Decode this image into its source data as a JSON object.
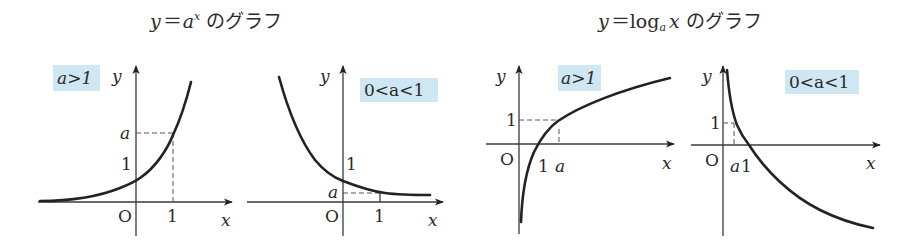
{
  "titles": {
    "exp": {
      "y": "y",
      "eq": "＝",
      "base": "a",
      "exp": "x",
      "suffix": "のグラフ"
    },
    "log": {
      "y": "y",
      "eq": "＝",
      "log": "log",
      "base": "a",
      "arg": "x",
      "suffix": "のグラフ"
    }
  },
  "graphs": [
    {
      "id": "exp-a-gt-1",
      "condition": "a>1",
      "axis_x": "x",
      "axis_y": "y",
      "origin": "O",
      "tick_x": [
        "1"
      ],
      "tick_y": [
        "1",
        "a"
      ]
    },
    {
      "id": "exp-a-lt-1",
      "condition": "0<a<1",
      "axis_x": "x",
      "axis_y": "y",
      "origin": "O",
      "tick_x": [
        "1"
      ],
      "tick_y": [
        "1",
        "a"
      ]
    },
    {
      "id": "log-a-gt-1",
      "condition": "a>1",
      "axis_x": "x",
      "axis_y": "y",
      "origin": "O",
      "tick_x": [
        "1",
        "a"
      ],
      "tick_y": [
        "1"
      ]
    },
    {
      "id": "log-a-lt-1",
      "condition": "0<a<1",
      "axis_x": "x",
      "axis_y": "y",
      "origin": "O",
      "tick_x": [
        "a",
        "1"
      ],
      "tick_y": [
        "1"
      ]
    }
  ],
  "colors": {
    "tag_bg": "#cfe6f3",
    "ink": "#222222"
  }
}
